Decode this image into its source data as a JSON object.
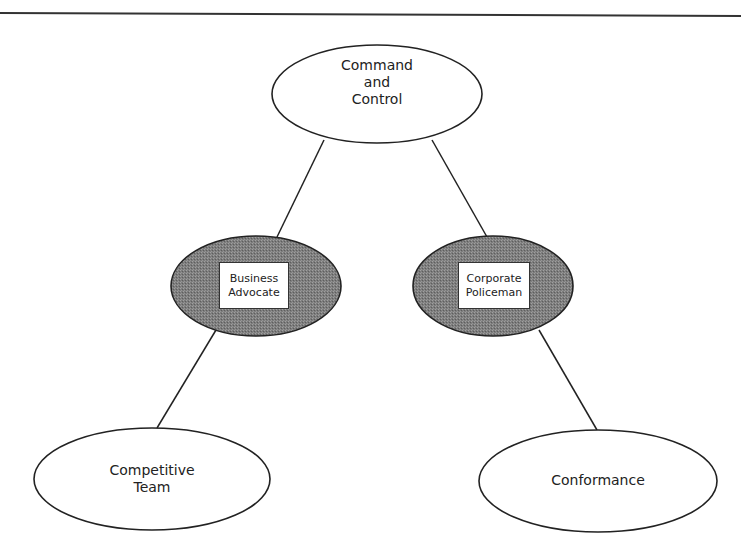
{
  "diagram": {
    "type": "hierarchy",
    "colors": {
      "line": "#222222",
      "filled_node": "#7a7a7a",
      "plain_node": "#ffffff"
    },
    "nodes": {
      "top": {
        "id": "command-and-control",
        "lines": [
          "Command",
          "and",
          "Control"
        ],
        "style": "plain"
      },
      "mid_left": {
        "id": "business-advocate",
        "lines": [
          "Business",
          "Advocate"
        ],
        "style": "filled-with-box"
      },
      "mid_right": {
        "id": "corporate-policeman",
        "lines": [
          "Corporate",
          "Policeman"
        ],
        "style": "filled-with-box"
      },
      "bottom_left": {
        "id": "competitive-team",
        "lines": [
          "Competitive",
          "Team"
        ],
        "style": "plain"
      },
      "bottom_right": {
        "id": "conformance",
        "lines": [
          "Conformance"
        ],
        "style": "plain"
      }
    },
    "edges": [
      {
        "from": "command-and-control",
        "to": "business-advocate"
      },
      {
        "from": "command-and-control",
        "to": "corporate-policeman"
      },
      {
        "from": "business-advocate",
        "to": "competitive-team"
      },
      {
        "from": "corporate-policeman",
        "to": "conformance"
      }
    ]
  }
}
